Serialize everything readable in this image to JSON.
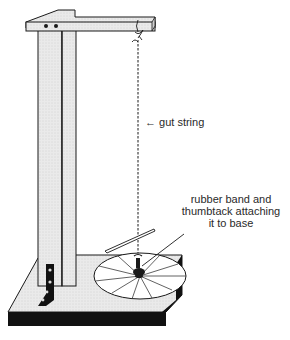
{
  "figure": {
    "labels": {
      "gut_string": "← gut string",
      "rubber_band_line1": "rubber band and",
      "rubber_band_line2": "thumbtack attaching",
      "rubber_band_line3": "it to base"
    },
    "colors": {
      "ink": "#1a1a1a",
      "wood_fill": "#e6e6e6",
      "shadow": "#111111",
      "background": "#ffffff"
    }
  }
}
